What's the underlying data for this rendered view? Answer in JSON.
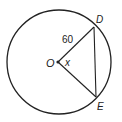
{
  "diagram": {
    "type": "circle-geometry",
    "circle": {
      "center": {
        "x": 59,
        "y": 62
      },
      "radius": 52,
      "stroke": "#222222"
    },
    "points": {
      "center": {
        "label": "O",
        "x": 58,
        "y": 62
      },
      "D": {
        "label": "D",
        "x": 94,
        "y": 27
      },
      "E": {
        "label": "E",
        "x": 96,
        "y": 97
      }
    },
    "segments": [
      {
        "from": "O",
        "to": "D",
        "label": "60"
      },
      {
        "from": "O",
        "to": "E",
        "label": ""
      },
      {
        "from": "D",
        "to": "E",
        "label": ""
      }
    ],
    "labels": {
      "radius_length": "60",
      "central_angle": "x",
      "center_point": "O",
      "point_d": "D",
      "point_e": "E"
    }
  }
}
